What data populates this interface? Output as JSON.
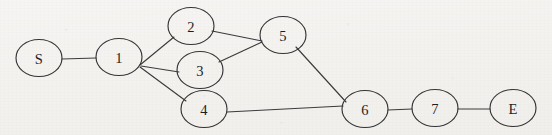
{
  "figure": {
    "background_color": "#f4f3f0",
    "stroke_color": "#343436",
    "label_color": "#1d1d1f",
    "width": 552,
    "height": 135
  },
  "chart_data": {
    "type": "diagram",
    "graph_type": "undirected-node-link-graph",
    "title": "",
    "node_shape": "ellipse",
    "node_rx": 23,
    "node_ry": 18.5,
    "nodes": [
      {
        "id": "S",
        "label": "S",
        "cx": 39,
        "cy": 58
      },
      {
        "id": "1",
        "label": "1",
        "cx": 119,
        "cy": 57
      },
      {
        "id": "2",
        "label": "2",
        "cx": 191,
        "cy": 26
      },
      {
        "id": "3",
        "label": "3",
        "cx": 200,
        "cy": 70
      },
      {
        "id": "4",
        "label": "4",
        "cx": 204,
        "cy": 109
      },
      {
        "id": "5",
        "label": "5",
        "cx": 283,
        "cy": 35
      },
      {
        "id": "6",
        "label": "6",
        "cx": 365,
        "cy": 109
      },
      {
        "id": "7",
        "label": "7",
        "cx": 435,
        "cy": 108
      },
      {
        "id": "E",
        "label": "E",
        "cx": 513,
        "cy": 108
      }
    ],
    "edges": [
      {
        "source": "S",
        "target": "1",
        "x1": 62,
        "y1": 59,
        "x2": 96,
        "y2": 58
      },
      {
        "source": "1",
        "target": "2",
        "x1": 140,
        "y1": 65,
        "x2": 174,
        "y2": 37
      },
      {
        "source": "1",
        "target": "3",
        "x1": 141,
        "y1": 66,
        "x2": 179,
        "y2": 72
      },
      {
        "source": "1",
        "target": "4",
        "x1": 140,
        "y1": 67,
        "x2": 186,
        "y2": 101
      },
      {
        "source": "2",
        "target": "5",
        "x1": 212,
        "y1": 31,
        "x2": 262,
        "y2": 41
      },
      {
        "source": "3",
        "target": "5",
        "x1": 219,
        "y1": 62,
        "x2": 262,
        "y2": 42
      },
      {
        "source": "5",
        "target": "6",
        "x1": 296,
        "y1": 47,
        "x2": 346,
        "y2": 102
      },
      {
        "source": "4",
        "target": "6",
        "x1": 227,
        "y1": 112,
        "x2": 343,
        "y2": 106
      },
      {
        "source": "6",
        "target": "7",
        "x1": 388,
        "y1": 110,
        "x2": 412,
        "y2": 109
      },
      {
        "source": "7",
        "target": "E",
        "x1": 458,
        "y1": 109,
        "x2": 490,
        "y2": 109
      }
    ],
    "node_count": 9,
    "edge_count": 10
  }
}
